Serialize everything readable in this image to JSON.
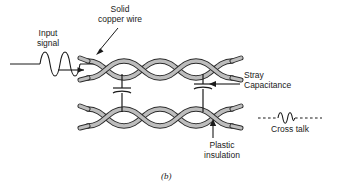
{
  "figure": {
    "caption": "(b)"
  },
  "labels": {
    "solid_copper_wire": "Solid\ncopper wire",
    "input_signal": "Input\nsignal",
    "stray_capacitance": "Stray\nCapacitance",
    "plastic_insulation": "Plastic\ninsulation",
    "cross_talk": "Cross talk"
  },
  "icons": {
    "input_waveform": "sine-wave-icon",
    "signal_arrow": "right-arrow-icon",
    "copper_wire_pointer": "diagonal-arrow-icon",
    "stray_cap_pointer": "left-arrow-icon",
    "plastic_ins_pointer": "up-arrow-icon",
    "capacitor_symbol": "capacitor-icon",
    "crosstalk_waveform": "dashed-wave-icon"
  },
  "colors": {
    "line": "#1a1a1a",
    "wire_fill": "#b8b8b8",
    "wire_stroke": "#2b2b2b",
    "background": "#ffffff"
  },
  "geometry": {
    "width": 337,
    "height": 196,
    "top_pair_center_y": 70,
    "bottom_pair_center_y": 117,
    "pair_left_x": 88,
    "pair_right_x": 232,
    "capacitor_x": [
      122,
      203
    ],
    "twist_count": 3
  }
}
